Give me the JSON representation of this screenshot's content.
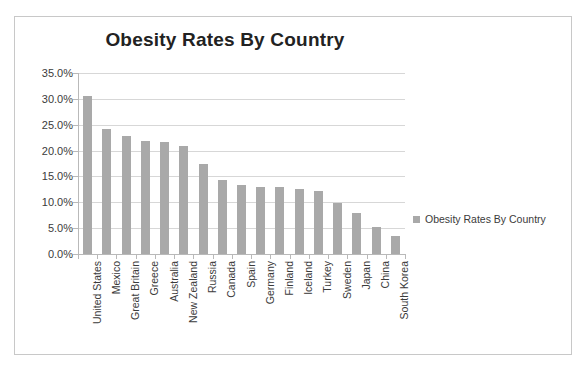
{
  "chart_data": {
    "type": "bar",
    "title": "Obesity Rates By Country",
    "xlabel": "",
    "ylabel": "",
    "ylim": [
      0,
      35
    ],
    "ytick_labels": [
      "35.0%",
      "30.0%",
      "25.0%",
      "20.0%",
      "15.0%",
      "10.0%",
      "5.0%",
      "0.0%"
    ],
    "ytick_values": [
      35,
      30,
      25,
      20,
      15,
      10,
      5,
      0
    ],
    "grid": true,
    "legend_position": "right",
    "legend": [
      "Obesity Rates By Country"
    ],
    "series_name": "Obesity Rates By Country",
    "bar_color": "#a9a9a9",
    "categories": [
      "United States",
      "Mexico",
      "Great Britain",
      "Greece",
      "Australia",
      "New Zealand",
      "Russia",
      "Canada",
      "Spain",
      "Germany",
      "Finland",
      "Iceland",
      "Turkey",
      "Sweden",
      "Japan",
      "China",
      "South Korea"
    ],
    "values": [
      30.6,
      24.2,
      22.9,
      21.9,
      21.7,
      20.9,
      17.5,
      14.4,
      13.3,
      13.0,
      13.0,
      12.5,
      12.1,
      9.9,
      7.9,
      5.2,
      3.5
    ]
  },
  "colors": {
    "bar": "#a9a9a9",
    "gridline": "#d7d7d7",
    "axis": "#b9b9b9",
    "text": "#3b3b3b",
    "title": "#222222",
    "frame_border": "#c8c8c8",
    "background": "#ffffff"
  }
}
